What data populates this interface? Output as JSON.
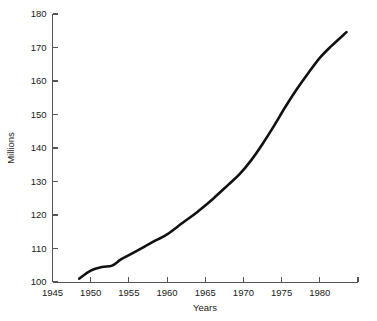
{
  "chart_data": {
    "type": "line",
    "title": "",
    "xlabel": "Years",
    "ylabel": "Millions",
    "xlim": [
      1945,
      1985
    ],
    "ylim": [
      100,
      180
    ],
    "grid": false,
    "legend": false,
    "x_ticks": [
      1945,
      1950,
      1955,
      1960,
      1965,
      1970,
      1975,
      1980,
      1985
    ],
    "x_tick_labels": [
      "1945",
      "1950",
      "1955",
      "1960",
      "1965",
      "1970",
      "1975",
      "1980",
      ""
    ],
    "y_ticks": [
      100,
      110,
      120,
      130,
      140,
      150,
      160,
      170,
      180
    ],
    "y_tick_labels": [
      "100",
      "110",
      "120",
      "130",
      "140",
      "150",
      "160",
      "170",
      "180"
    ],
    "line_color": "#111111",
    "axis_color": "#555555",
    "background_color": "#ffffff",
    "series": [
      {
        "name": "Millions",
        "x": [
          1948.5,
          1950.0,
          1951.5,
          1952.8,
          1954.0,
          1955.5,
          1957.0,
          1958.5,
          1960.0,
          1962.0,
          1964.0,
          1966.0,
          1968.0,
          1969.5,
          1971.0,
          1972.5,
          1974.0,
          1975.5,
          1977.0,
          1978.5,
          1980.0,
          1981.5,
          1983.5
        ],
        "y": [
          101.0,
          103.4,
          104.5,
          104.9,
          106.8,
          108.6,
          110.5,
          112.4,
          114.2,
          117.6,
          121.0,
          124.8,
          129.0,
          132.2,
          136.3,
          141.2,
          146.6,
          152.3,
          157.6,
          162.4,
          166.9,
          170.4,
          174.6
        ]
      }
    ]
  },
  "axis_labels": {
    "x_title": "Years",
    "y_title": "Millions"
  }
}
